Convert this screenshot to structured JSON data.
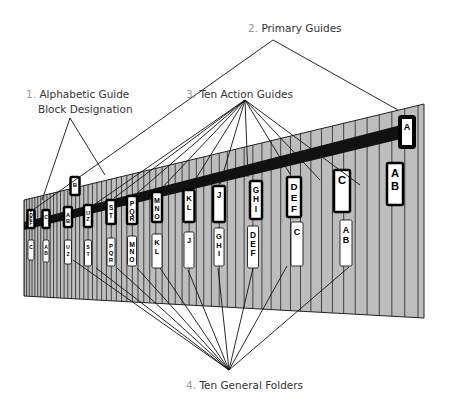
{
  "labels": {
    "alphabetic_num": "1.",
    "alphabetic_line1": "Alphabetic Guide",
    "alphabetic_line2": "Block Designation",
    "primary_num": "2.",
    "primary": "Primary Guides",
    "action_num": "3.",
    "action": "Ten Action Guides",
    "folders_num": "4.",
    "folders": "Ten General Folders"
  },
  "primary_guides": [
    "B",
    "A"
  ],
  "action_guides": [
    "DEF",
    "C",
    "AB",
    "UZ",
    "ST",
    "PQR",
    "MNO",
    "KL",
    "J",
    "GHI",
    "DEF",
    "C",
    "AB"
  ],
  "general_folders": [
    "C",
    "AB",
    "UZ",
    "ST",
    "PQR",
    "MNO",
    "KL",
    "J",
    "GHI",
    "DEF",
    "C",
    "AB"
  ],
  "colors": {
    "stripe_fill": "#bdbdbd",
    "stripe_line": "#222222",
    "tab_border": "#000000",
    "tab_fill": "#ffffff",
    "number_color": "#999999"
  }
}
